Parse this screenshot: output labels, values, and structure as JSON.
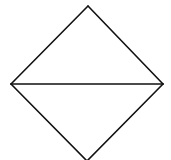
{
  "diagram": {
    "type": "rhombus-bisected",
    "stroke_color": "#111111",
    "background_color": "#ffffff",
    "stroke_width": 1.6,
    "vertices": {
      "top": [
        88,
        6
      ],
      "left": [
        11,
        84
      ],
      "right": [
        163,
        84
      ],
      "bottom": [
        87,
        161
      ]
    },
    "segments": [
      {
        "name": "top-left-edge",
        "from": "top",
        "to": "left"
      },
      {
        "name": "top-right-edge",
        "from": "top",
        "to": "right"
      },
      {
        "name": "bottom-left-edge",
        "from": "left",
        "to": "bottom"
      },
      {
        "name": "bottom-right-edge",
        "from": "right",
        "to": "bottom"
      },
      {
        "name": "horizontal-diagonal",
        "from": "left",
        "to": "right"
      }
    ],
    "labels": []
  }
}
